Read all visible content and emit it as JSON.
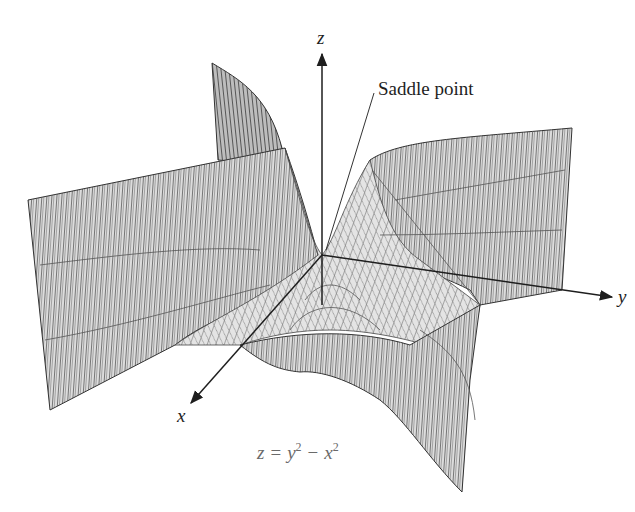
{
  "figure": {
    "annotation": "Saddle point",
    "equation": {
      "lhs": "z",
      "eq": "=",
      "term1_base": "y",
      "term1_exp": "2",
      "minus": "−",
      "term2_base": "x",
      "term2_exp": "2"
    },
    "axes": {
      "x": "x",
      "y": "y",
      "z": "z"
    },
    "colors": {
      "mesh_line": "#3a3a3a",
      "surface_fill": "#d9d9d9",
      "axis": "#1e1e1e",
      "equation_text": "#6a6a6a",
      "background": "#ffffff"
    }
  }
}
